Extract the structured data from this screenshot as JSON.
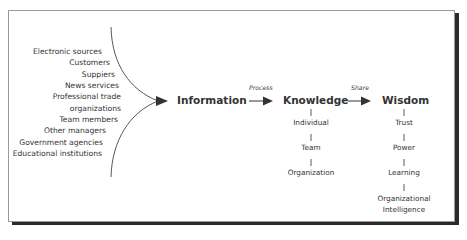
{
  "sources": [
    "Electronic sources",
    "Customers",
    "Suppiers",
    "News services",
    "Professional trade",
    "organizations",
    "Team members",
    "Other managers",
    "Government agencies",
    "Educational institutions"
  ],
  "stages": {
    "information": "Information",
    "knowledge": "Knowledge",
    "wisdom": "Wisdom"
  },
  "transitions": {
    "process": "Process",
    "share": "Share"
  },
  "knowledge_levels": [
    "Individual",
    "Team",
    "Organization"
  ],
  "wisdom_levels": [
    "Trust",
    "Power",
    "Learning",
    "Organizational",
    "Intelligence"
  ],
  "colors": {
    "text": "#333333",
    "frame_border": "#9a9a9a",
    "frame_shadow": "#2b2b2b"
  }
}
